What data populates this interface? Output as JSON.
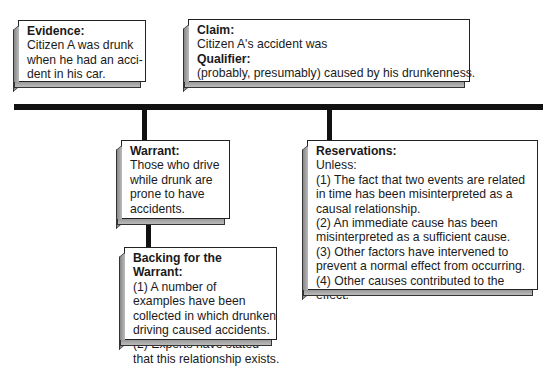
{
  "evidence": {
    "title": "Evidence:",
    "lines": [
      "Citizen A was drunk",
      "when he had an acci-",
      "dent in his car."
    ]
  },
  "claim": {
    "title": "Claim:",
    "text": "Citizen A's accident was",
    "qualifier_title": "Qualifier:",
    "qualifier_text": "(probably, presumably) caused by his drunkenness."
  },
  "warrant": {
    "title": "Warrant:",
    "lines": [
      "Those who drive",
      "while drunk are",
      "prone to have",
      "accidents."
    ]
  },
  "backing": {
    "title": "Backing for the Warrant:",
    "lines": [
      "(1) A number of",
      "examples have been",
      "collected in which drunken",
      "driving caused accidents.",
      "(2) Experts have stated",
      "that this relationship exists."
    ]
  },
  "reservations": {
    "title": "Reservations:",
    "lines": [
      "Unless:",
      "(1) The fact that two events are related",
      "in time has been misinterpreted as a",
      "causal relationship.",
      "(2) An immediate cause has been",
      "misinterpreted as a sufficient cause.",
      "(3) Other factors have intervened to",
      "prevent a normal effect from occurring.",
      "(4) Other causes contributed to the",
      "effect."
    ]
  }
}
